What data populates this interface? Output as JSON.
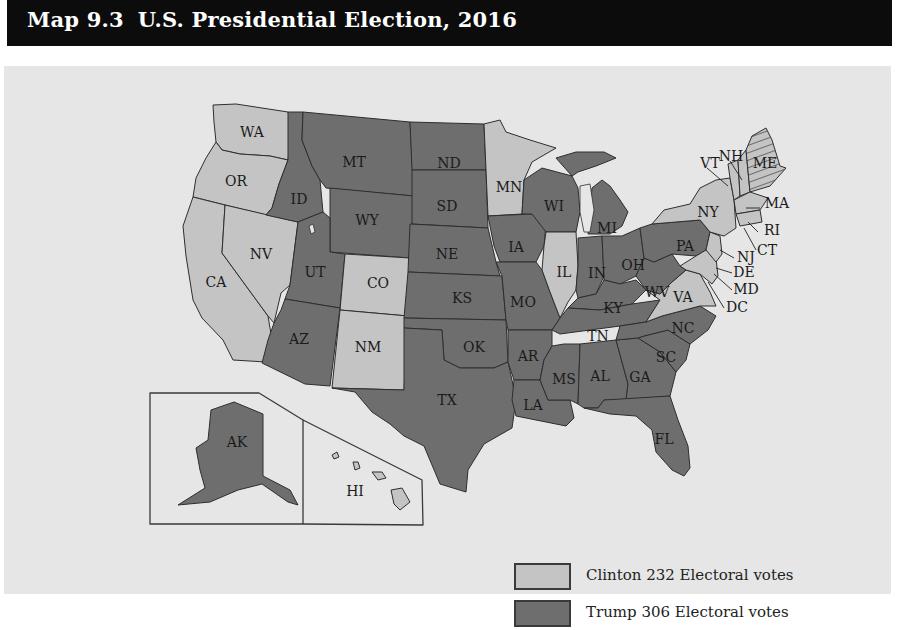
{
  "header": {
    "map_number": "Map 9.3",
    "title": "U.S. Presidential Election, 2016"
  },
  "colors": {
    "clinton": "#c4c4c4",
    "trump": "#6e6e6e",
    "background": "#e6e6e6",
    "title_bar": "#0c0c0c",
    "border": "#2e2e2e"
  },
  "legend": {
    "items": [
      {
        "candidate": "Clinton",
        "label": "Clinton 232 Electoral votes",
        "color": "#c4c4c4"
      },
      {
        "candidate": "Trump",
        "label": "Trump 306 Electoral votes",
        "color": "#6e6e6e"
      }
    ]
  },
  "map": {
    "insets": [
      {
        "name": "Alaska",
        "label": "AK"
      },
      {
        "name": "Hawaii",
        "label": "HI"
      }
    ],
    "states": {
      "WA": "Clinton",
      "OR": "Clinton",
      "CA": "Clinton",
      "NV": "Clinton",
      "CO": "Clinton",
      "NM": "Clinton",
      "MN": "Clinton",
      "IL": "Clinton",
      "VA": "Clinton",
      "NY": "Clinton",
      "VT": "Clinton",
      "NH": "Clinton",
      "ME": "Split",
      "MA": "Clinton",
      "RI": "Clinton",
      "CT": "Clinton",
      "NJ": "Clinton",
      "DE": "Clinton",
      "MD": "Clinton",
      "DC": "Clinton",
      "HI": "Clinton",
      "ID": "Trump",
      "MT": "Trump",
      "WY": "Trump",
      "UT": "Trump",
      "AZ": "Trump",
      "ND": "Trump",
      "SD": "Trump",
      "NE": "Trump",
      "KS": "Trump",
      "OK": "Trump",
      "TX": "Trump",
      "IA": "Trump",
      "MO": "Trump",
      "AR": "Trump",
      "LA": "Trump",
      "WI": "Trump",
      "MI": "Trump",
      "IN": "Trump",
      "OH": "Trump",
      "KY": "Trump",
      "TN": "Trump",
      "MS": "Trump",
      "AL": "Trump",
      "GA": "Trump",
      "FL": "Trump",
      "SC": "Trump",
      "NC": "Trump",
      "WV": "Trump",
      "PA": "Trump",
      "AK": "Trump"
    },
    "labels": {
      "WA": "WA",
      "OR": "OR",
      "CA": "CA",
      "NV": "NV",
      "ID": "ID",
      "MT": "MT",
      "WY": "WY",
      "UT": "UT",
      "AZ": "AZ",
      "CO": "CO",
      "NM": "NM",
      "ND": "ND",
      "SD": "SD",
      "NE": "NE",
      "KS": "KS",
      "OK": "OK",
      "TX": "TX",
      "MN": "MN",
      "IA": "IA",
      "MO": "MO",
      "AR": "AR",
      "LA": "LA",
      "WI": "WI",
      "IL": "IL",
      "MI": "MI",
      "IN": "IN",
      "OH": "OH",
      "KY": "KY",
      "TN": "TN",
      "MS": "MS",
      "AL": "AL",
      "GA": "GA",
      "FL": "FL",
      "SC": "SC",
      "NC": "NC",
      "VA": "VA",
      "WV": "WV",
      "PA": "PA",
      "NY": "NY",
      "VT": "VT",
      "NH": "NH",
      "ME": "ME",
      "MA": "MA",
      "RI": "RI",
      "CT": "CT",
      "NJ": "NJ",
      "DE": "DE",
      "MD": "MD",
      "DC": "DC",
      "AK": "AK",
      "HI": "HI"
    }
  }
}
